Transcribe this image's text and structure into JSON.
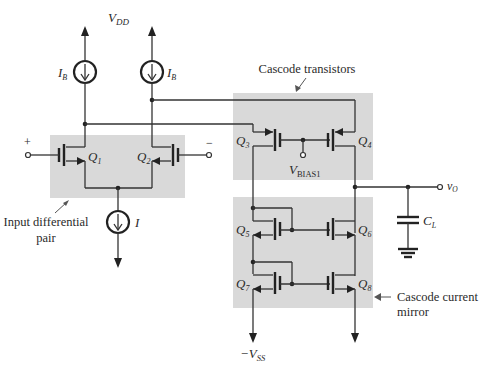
{
  "diagram": {
    "type": "circuit-schematic",
    "supplies": {
      "positive": "V",
      "positive_sub": "DD",
      "negative": "−V",
      "negative_sub": "SS"
    },
    "sources": {
      "left_bias": {
        "label": "I",
        "sub": "B"
      },
      "right_bias": {
        "label": "I",
        "sub": "B"
      },
      "tail": {
        "label": "I"
      }
    },
    "transistors": [
      {
        "id": "Q1",
        "label": "Q",
        "sub": "1",
        "type": "NMOS"
      },
      {
        "id": "Q2",
        "label": "Q",
        "sub": "2",
        "type": "NMOS"
      },
      {
        "id": "Q3",
        "label": "Q",
        "sub": "3",
        "type": "PMOS"
      },
      {
        "id": "Q4",
        "label": "Q",
        "sub": "4",
        "type": "PMOS"
      },
      {
        "id": "Q5",
        "label": "Q",
        "sub": "5",
        "type": "NMOS"
      },
      {
        "id": "Q6",
        "label": "Q",
        "sub": "6",
        "type": "NMOS"
      },
      {
        "id": "Q7",
        "label": "Q",
        "sub": "7",
        "type": "NMOS"
      },
      {
        "id": "Q8",
        "label": "Q",
        "sub": "8",
        "type": "NMOS"
      }
    ],
    "inputs": {
      "plus": "+",
      "minus": "−"
    },
    "bias": {
      "label": "V",
      "sub": "BIAS1"
    },
    "output": {
      "label": "v",
      "sub": "O"
    },
    "load": {
      "label": "C",
      "sub": "L"
    },
    "callouts": {
      "input_pair": [
        "Input differential",
        "pair"
      ],
      "cascode_transistors": "Cascode transistors",
      "cascode_mirror": [
        "Cascode current",
        "mirror"
      ]
    },
    "colors": {
      "highlight_box": "#d9d9d9",
      "wire": "#333333"
    }
  }
}
